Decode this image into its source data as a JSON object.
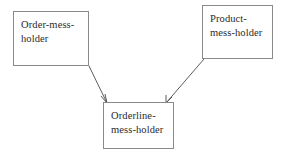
{
  "diagram": {
    "type": "node-link-diagram",
    "background_color": "#ffffff",
    "border_color": "#8a8a8a",
    "text_color": "#2b2b2b",
    "connector_color": "#4a4a4a",
    "nodes": [
      {
        "id": "order",
        "label": "Order-mess-\nholder",
        "position": "top-left"
      },
      {
        "id": "product",
        "label": "Product-\nmess-holder",
        "position": "top-right"
      },
      {
        "id": "orderline",
        "label": "Orderline-\nmess-holder",
        "position": "bottom-center"
      }
    ],
    "connectors": [
      {
        "id": "order-to-orderline",
        "from": "order",
        "to": "orderline",
        "arrow": "end"
      },
      {
        "id": "product-to-orderline",
        "from": "product",
        "to": "orderline",
        "arrow": "end"
      }
    ]
  }
}
